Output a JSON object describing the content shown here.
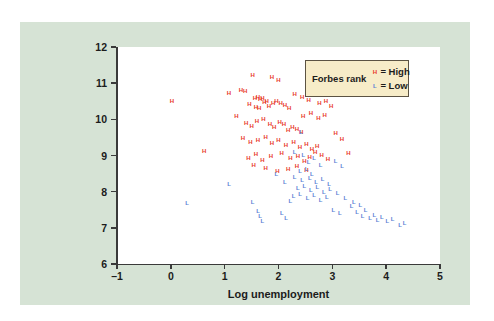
{
  "chart_data": {
    "type": "scatter",
    "title": "",
    "xlabel": "Log unemployment",
    "ylabel": "Log GDP per capita",
    "xlim": [
      -1,
      5
    ],
    "ylim": [
      6,
      12
    ],
    "xticks": [
      -1,
      0,
      1,
      2,
      3,
      4,
      5
    ],
    "xtick_labels": [
      "–1",
      "0",
      "1",
      "2",
      "3",
      "4",
      "5"
    ],
    "yticks": [
      6,
      7,
      8,
      9,
      10,
      11,
      12
    ],
    "ytick_labels": [
      "6",
      "7",
      "8",
      "9",
      "10",
      "11",
      "12"
    ],
    "grid": false,
    "legend": {
      "position": "top-right",
      "title": "Forbes rank",
      "entries": [
        {
          "marker": "H",
          "label": "= High",
          "color": "#e8392a"
        },
        {
          "marker": "L",
          "label": "= Low",
          "color": "#5b7fd4"
        }
      ]
    },
    "series": [
      {
        "name": "High",
        "marker": "H",
        "color": "#e8392a",
        "points": [
          [
            0.02,
            10.52
          ],
          [
            0.62,
            9.12
          ],
          [
            1.08,
            10.72
          ],
          [
            1.3,
            10.8
          ],
          [
            1.38,
            10.79
          ],
          [
            1.52,
            11.22
          ],
          [
            1.88,
            11.18
          ],
          [
            2.0,
            11.08
          ],
          [
            1.22,
            10.1
          ],
          [
            1.46,
            10.42
          ],
          [
            1.56,
            10.58
          ],
          [
            1.62,
            10.62
          ],
          [
            1.66,
            10.55
          ],
          [
            1.7,
            10.6
          ],
          [
            1.74,
            10.48
          ],
          [
            1.78,
            10.52
          ],
          [
            1.58,
            10.35
          ],
          [
            1.64,
            10.3
          ],
          [
            1.82,
            10.38
          ],
          [
            1.9,
            10.44
          ],
          [
            1.96,
            10.5
          ],
          [
            2.04,
            10.46
          ],
          [
            2.12,
            10.4
          ],
          [
            2.2,
            10.3
          ],
          [
            1.4,
            9.9
          ],
          [
            1.5,
            9.82
          ],
          [
            1.6,
            9.95
          ],
          [
            1.72,
            10.02
          ],
          [
            1.84,
            9.88
          ],
          [
            1.92,
            9.78
          ],
          [
            2.02,
            9.92
          ],
          [
            2.1,
            9.86
          ],
          [
            2.18,
            9.7
          ],
          [
            2.26,
            9.8
          ],
          [
            2.34,
            9.74
          ],
          [
            2.42,
            9.66
          ],
          [
            1.34,
            9.48
          ],
          [
            1.48,
            9.38
          ],
          [
            1.62,
            9.44
          ],
          [
            1.76,
            9.52
          ],
          [
            1.88,
            9.34
          ],
          [
            2.0,
            9.42
          ],
          [
            2.14,
            9.3
          ],
          [
            2.28,
            9.36
          ],
          [
            2.4,
            9.24
          ],
          [
            2.52,
            9.32
          ],
          [
            2.62,
            9.18
          ],
          [
            2.72,
            9.26
          ],
          [
            1.44,
            8.94
          ],
          [
            1.58,
            9.04
          ],
          [
            1.7,
            8.88
          ],
          [
            1.86,
            8.98
          ],
          [
            2.06,
            9.08
          ],
          [
            2.22,
            8.92
          ],
          [
            2.36,
            9.0
          ],
          [
            2.48,
            8.84
          ],
          [
            2.58,
            8.96
          ],
          [
            2.68,
            9.1
          ],
          [
            2.8,
            9.02
          ],
          [
            2.92,
            8.9
          ],
          [
            2.3,
            10.7
          ],
          [
            2.44,
            10.62
          ],
          [
            2.56,
            10.54
          ],
          [
            2.66,
            10.66
          ],
          [
            2.76,
            10.44
          ],
          [
            2.88,
            10.52
          ],
          [
            2.98,
            10.36
          ],
          [
            2.46,
            10.1
          ],
          [
            2.6,
            10.18
          ],
          [
            2.74,
            10.04
          ],
          [
            2.86,
            10.12
          ],
          [
            3.06,
            9.62
          ],
          [
            3.18,
            9.46
          ],
          [
            3.3,
            9.08
          ],
          [
            2.18,
            8.62
          ],
          [
            2.34,
            8.7
          ],
          [
            1.98,
            8.58
          ],
          [
            1.76,
            8.66
          ],
          [
            1.54,
            8.74
          ],
          [
            2.52,
            8.6
          ]
        ]
      },
      {
        "name": "Low",
        "marker": "L",
        "color": "#5b7fd4",
        "points": [
          [
            0.3,
            7.7
          ],
          [
            1.08,
            8.22
          ],
          [
            1.52,
            7.72
          ],
          [
            1.62,
            7.46
          ],
          [
            1.66,
            7.32
          ],
          [
            1.7,
            7.2
          ],
          [
            2.22,
            7.74
          ],
          [
            2.42,
            9.66
          ],
          [
            2.3,
            9.1
          ],
          [
            2.46,
            9.02
          ],
          [
            2.56,
            8.82
          ],
          [
            2.66,
            8.92
          ],
          [
            2.78,
            8.74
          ],
          [
            2.4,
            8.56
          ],
          [
            2.52,
            8.64
          ],
          [
            2.62,
            8.48
          ],
          [
            2.3,
            8.4
          ],
          [
            2.44,
            8.32
          ],
          [
            2.58,
            8.38
          ],
          [
            2.7,
            8.26
          ],
          [
            2.82,
            8.34
          ],
          [
            2.94,
            8.2
          ],
          [
            2.36,
            8.1
          ],
          [
            2.48,
            8.16
          ],
          [
            2.6,
            8.04
          ],
          [
            2.72,
            8.12
          ],
          [
            2.84,
            7.98
          ],
          [
            2.96,
            8.06
          ],
          [
            2.28,
            7.88
          ],
          [
            2.4,
            7.94
          ],
          [
            2.54,
            7.82
          ],
          [
            2.66,
            7.9
          ],
          [
            2.78,
            7.76
          ],
          [
            2.9,
            7.84
          ],
          [
            3.06,
            8.86
          ],
          [
            3.18,
            8.7
          ],
          [
            3.1,
            7.96
          ],
          [
            3.24,
            7.82
          ],
          [
            3.36,
            7.6
          ],
          [
            3.02,
            7.48
          ],
          [
            3.14,
            7.4
          ],
          [
            3.46,
            7.44
          ],
          [
            3.56,
            7.34
          ],
          [
            3.62,
            7.5
          ],
          [
            3.7,
            7.28
          ],
          [
            3.78,
            7.36
          ],
          [
            3.84,
            7.22
          ],
          [
            3.92,
            7.3
          ],
          [
            4.02,
            7.18
          ],
          [
            4.12,
            7.24
          ],
          [
            4.26,
            7.08
          ],
          [
            4.34,
            7.14
          ],
          [
            3.4,
            7.72
          ],
          [
            3.52,
            7.64
          ],
          [
            2.06,
            7.4
          ],
          [
            2.14,
            7.28
          ],
          [
            1.96,
            8.48
          ],
          [
            2.12,
            8.26
          ]
        ]
      }
    ]
  }
}
